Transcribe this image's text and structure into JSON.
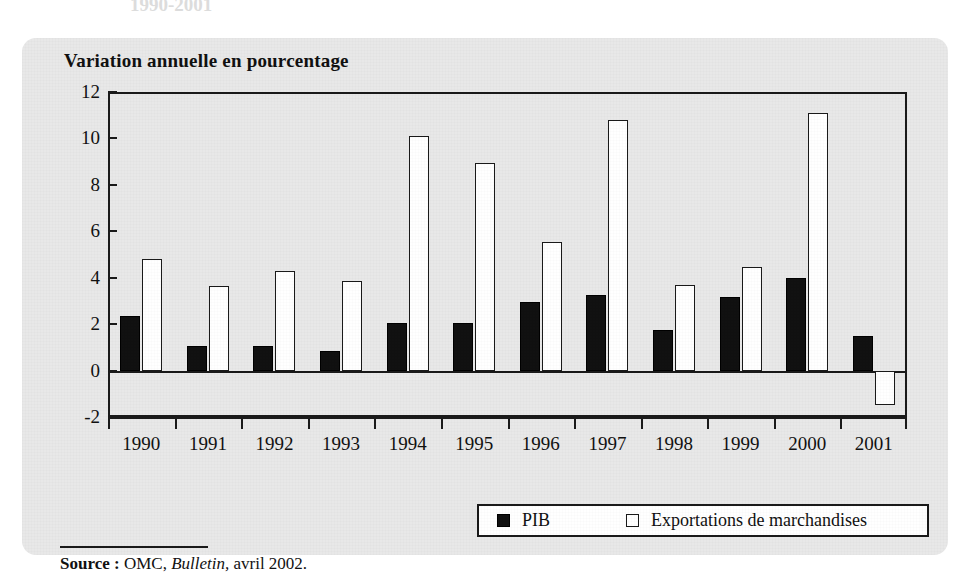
{
  "figure": {
    "cut_heading": "1990-2001",
    "title": "Variation annuelle en pourcentage",
    "source_label": "Source :",
    "source_org": "OMC,",
    "source_pub": "Bulletin,",
    "source_date": "avril 2002."
  },
  "legend": {
    "pib_label": "PIB",
    "exports_label": "Exportations de marchandises"
  },
  "colors": {
    "panel_background": "#e8e8e8",
    "axis": "#1a1a1a",
    "pib_fill": "#111111",
    "exports_fill": "#ffffff",
    "text": "#111111"
  },
  "chart_data": {
    "type": "bar",
    "title": "Variation annuelle en pourcentage",
    "xlabel": "",
    "ylabel": "Variation annuelle en pourcentage",
    "ylim": [
      -2,
      12
    ],
    "yticks": [
      -2,
      0,
      2,
      4,
      6,
      8,
      10,
      12
    ],
    "grid": false,
    "legend_position": "bottom-right",
    "categories": [
      "1990",
      "1991",
      "1992",
      "1993",
      "1994",
      "1995",
      "1996",
      "1997",
      "1998",
      "1999",
      "2000",
      "2001"
    ],
    "series": [
      {
        "name": "PIB",
        "values": [
          2.35,
          1.05,
          1.05,
          0.85,
          2.05,
          2.05,
          2.95,
          3.25,
          1.75,
          3.15,
          4.0,
          1.5
        ]
      },
      {
        "name": "Exportations de marchandises",
        "values": [
          4.8,
          3.65,
          4.3,
          3.85,
          10.1,
          8.95,
          5.55,
          10.8,
          3.7,
          4.45,
          11.1,
          -1.5
        ]
      }
    ]
  }
}
